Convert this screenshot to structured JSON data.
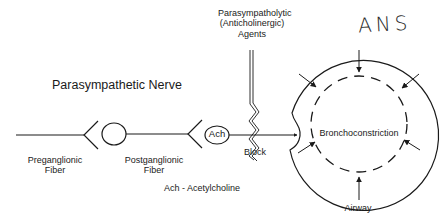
{
  "diagram": {
    "title": "Parasympathetic Nerve",
    "annotation_handwritten": "ANS",
    "agents_label": {
      "line1": "Parasympatholytic",
      "line2": "(Anticholinergic)",
      "line3": "Agents"
    },
    "nodes": {
      "preganglionic": {
        "line1": "Preganglionic",
        "line2": "Fiber"
      },
      "postganglionic": {
        "line1": "Postganglionic",
        "line2": "Fiber"
      },
      "ach": "Ach",
      "block": "Block",
      "center": "Bronchoconstriction",
      "airway": "Airway"
    },
    "legend": "Ach - Acetylcholine",
    "colors": {
      "stroke": "#1a1a1a",
      "background": "#ffffff"
    }
  }
}
